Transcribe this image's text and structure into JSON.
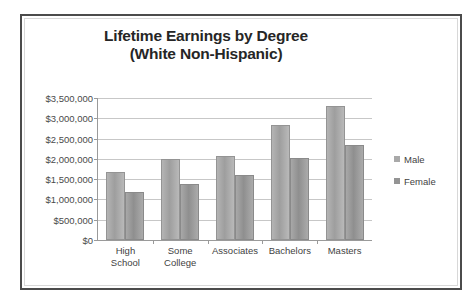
{
  "frame": {
    "border_color": "#4b4b4b",
    "background": "#ffffff"
  },
  "chart_data": {
    "type": "bar",
    "title": "Lifetime Earnings by Degree (White Non-Hispanic)",
    "title_line1": "Lifetime Earnings by Degree",
    "title_line2": "(White Non-Hispanic)",
    "xlabel": "",
    "ylabel": "",
    "categories": [
      "High School",
      "Some College",
      "Associates",
      "Bachelors",
      "Masters"
    ],
    "category_lines": [
      [
        "High",
        "School"
      ],
      [
        "Some",
        "College"
      ],
      [
        "Associates"
      ],
      [
        "Bachelors"
      ],
      [
        "Masters"
      ]
    ],
    "series": [
      {
        "name": "Male",
        "color": "#a9a9a9",
        "values": [
          1680000,
          2000000,
          2070000,
          2830000,
          3300000
        ]
      },
      {
        "name": "Female",
        "color": "#949494",
        "values": [
          1180000,
          1380000,
          1600000,
          2030000,
          2350000
        ]
      }
    ],
    "ylim": [
      0,
      3500000
    ],
    "ytick_values": [
      0,
      500000,
      1000000,
      1500000,
      2000000,
      2500000,
      3000000,
      3500000
    ],
    "ytick_labels": [
      "$0",
      "$500,000",
      "$1,000,000",
      "$1,500,000",
      "$2,000,000",
      "$2,500,000",
      "$3,000,000",
      "$3,500,000"
    ],
    "grid": true,
    "grid_color": "#c7c7c7",
    "legend_position": "right",
    "legend_entries": [
      "Male",
      "Female"
    ]
  }
}
